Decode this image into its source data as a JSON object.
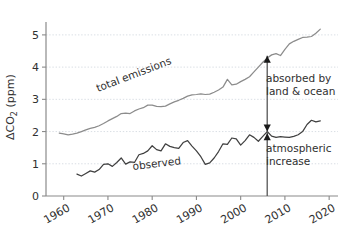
{
  "chart_data": {
    "type": "line",
    "title": "",
    "xlabel": "",
    "ylabel": "ΔCO₂ (ppm)",
    "ylabel_parts": {
      "delta": "ΔCO",
      "sub": "2",
      "unit": " (ppm)"
    },
    "xlim": [
      1956,
      2022
    ],
    "ylim": [
      0,
      5.4
    ],
    "grid": true,
    "grid_axis": "y",
    "legend": "inline-labels",
    "xticks": [
      1960,
      1970,
      1980,
      1990,
      2000,
      2010,
      2020
    ],
    "xtick_labels": [
      "1960",
      "1970",
      "1980",
      "1990",
      "2000",
      "2010",
      "2020"
    ],
    "yticks": [
      0,
      1,
      2,
      3,
      4,
      5
    ],
    "ytick_labels": [
      "0",
      "1",
      "2",
      "3",
      "4",
      "5"
    ],
    "series": [
      {
        "name": "total emissions",
        "color": "#8c8c8c",
        "label": "total emissions",
        "x": [
          1959,
          1960,
          1961,
          1962,
          1963,
          1964,
          1965,
          1966,
          1967,
          1968,
          1969,
          1970,
          1971,
          1972,
          1973,
          1974,
          1975,
          1976,
          1977,
          1978,
          1979,
          1980,
          1981,
          1982,
          1983,
          1984,
          1985,
          1986,
          1987,
          1988,
          1989,
          1990,
          1991,
          1992,
          1993,
          1994,
          1995,
          1996,
          1997,
          1998,
          1999,
          2000,
          2001,
          2002,
          2003,
          2004,
          2005,
          2006,
          2007,
          2008,
          2009,
          2010,
          2011,
          2012,
          2013,
          2014,
          2015,
          2016,
          2017,
          2018
        ],
        "values": [
          1.95,
          1.93,
          1.9,
          1.92,
          1.95,
          2.0,
          2.05,
          2.1,
          2.13,
          2.18,
          2.25,
          2.33,
          2.4,
          2.47,
          2.56,
          2.57,
          2.56,
          2.64,
          2.7,
          2.74,
          2.82,
          2.82,
          2.78,
          2.77,
          2.79,
          2.86,
          2.92,
          2.97,
          3.03,
          3.1,
          3.14,
          3.15,
          3.17,
          3.15,
          3.16,
          3.22,
          3.29,
          3.38,
          3.62,
          3.45,
          3.47,
          3.55,
          3.62,
          3.7,
          3.85,
          4.0,
          4.15,
          4.28,
          4.38,
          4.42,
          4.36,
          4.55,
          4.72,
          4.8,
          4.86,
          4.92,
          4.93,
          4.95,
          5.05,
          5.18
        ]
      },
      {
        "name": "observed",
        "color": "#404040",
        "label": "observed",
        "x": [
          1963,
          1964,
          1965,
          1966,
          1967,
          1968,
          1969,
          1970,
          1971,
          1972,
          1973,
          1974,
          1975,
          1976,
          1977,
          1978,
          1979,
          1980,
          1981,
          1982,
          1983,
          1984,
          1985,
          1986,
          1987,
          1988,
          1989,
          1990,
          1991,
          1992,
          1993,
          1994,
          1995,
          1996,
          1997,
          1998,
          1999,
          2000,
          2001,
          2002,
          2003,
          2004,
          2005,
          2006,
          2007,
          2008,
          2009,
          2010,
          2011,
          2012,
          2013,
          2014,
          2015,
          2016,
          2017,
          2018
        ],
        "values": [
          0.68,
          0.62,
          0.7,
          0.78,
          0.74,
          0.82,
          0.98,
          1.0,
          0.92,
          1.04,
          1.18,
          0.99,
          1.06,
          1.04,
          1.28,
          1.32,
          1.4,
          1.56,
          1.44,
          1.4,
          1.62,
          1.54,
          1.5,
          1.48,
          1.66,
          1.72,
          1.55,
          1.4,
          1.22,
          0.98,
          1.03,
          1.18,
          1.38,
          1.62,
          1.6,
          1.8,
          1.77,
          1.58,
          1.72,
          1.9,
          1.82,
          1.7,
          1.85,
          2.0,
          1.86,
          1.82,
          1.84,
          1.83,
          1.82,
          1.85,
          1.9,
          2.0,
          2.22,
          2.35,
          2.3,
          2.33
        ]
      }
    ],
    "annotations": [
      {
        "name": "absorbed-annotation",
        "lines": [
          "absorbed by",
          "land & ocean"
        ],
        "text": "absorbed by land & ocean",
        "arrow": {
          "x_year": 2006,
          "y_from": 2.0,
          "y_to": 4.35,
          "color": "#1a1a1a",
          "double_headed": true
        }
      },
      {
        "name": "atmospheric-increase-annotation",
        "lines": [
          "atmospheric",
          "increase"
        ],
        "text": "atmospheric increase",
        "arrow": {
          "x_year": 2006,
          "y_from": 0.0,
          "y_to": 1.95,
          "color": "#1a1a1a",
          "double_headed": false
        }
      }
    ],
    "marker_line": {
      "x_year": 2006,
      "color": "#555555"
    }
  },
  "axes": {
    "y_title": "ΔCO₂ (ppm)",
    "spine_color": "#8a8a8a",
    "grid_color": "#cfd6dd"
  }
}
